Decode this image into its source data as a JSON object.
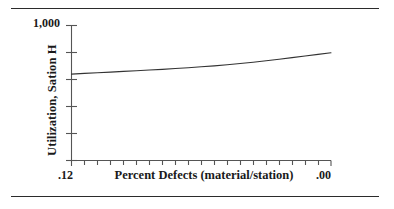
{
  "figure": {
    "top_rule": true,
    "bottom_rule": true,
    "line_color": "#333333",
    "axis_color": "#555555",
    "text_color": "#1a1a1a",
    "background": "#ffffff"
  },
  "chart_data": {
    "type": "line",
    "title": "",
    "xlabel": "Percent Defects (material/station)",
    "ylabel": "Utilization, Sation H",
    "x_tick_labels": [
      ".12",
      ".00"
    ],
    "y_tick_labels": [
      "1,000"
    ],
    "xlim": [
      0.12,
      0.0
    ],
    "ylim": [
      0,
      1000
    ],
    "x_axis_direction": "decreasing",
    "grid": false,
    "legend": null,
    "n_x_minor_ticks": 20,
    "n_y_ticks": 6,
    "x": [
      0.12,
      0.114,
      0.108,
      0.102,
      0.096,
      0.09,
      0.084,
      0.078,
      0.072,
      0.066,
      0.06,
      0.054,
      0.048,
      0.042,
      0.036,
      0.03,
      0.024,
      0.018,
      0.012,
      0.006,
      0.0
    ],
    "y": [
      640,
      645,
      650,
      655,
      660,
      665,
      670,
      675,
      681,
      687,
      694,
      701,
      709,
      718,
      728,
      739,
      750,
      762,
      774,
      786,
      798
    ],
    "series": [
      {
        "name": "Utilization, Sation H",
        "values": [
          640,
          645,
          650,
          655,
          660,
          665,
          670,
          675,
          681,
          687,
          694,
          701,
          709,
          718,
          728,
          739,
          750,
          762,
          774,
          786,
          798
        ]
      }
    ]
  }
}
